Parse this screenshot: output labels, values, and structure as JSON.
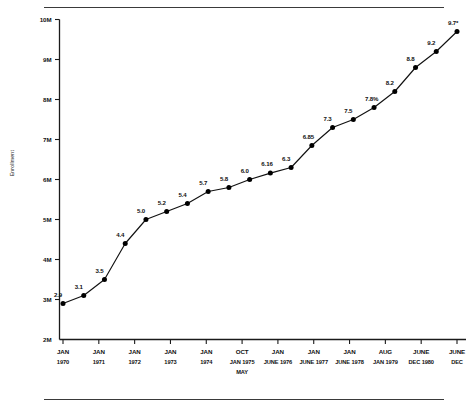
{
  "chart_data": {
    "type": "line",
    "title": "",
    "xlabel": "",
    "ylabel": "Enrollment",
    "ylim": [
      2,
      10
    ],
    "yticks": [
      "2M",
      "3M",
      "4M",
      "5M",
      "6M",
      "7M",
      "8M",
      "9M",
      "10M"
    ],
    "ytick_values": [
      2,
      3,
      4,
      5,
      6,
      7,
      8,
      9,
      10
    ],
    "grid": false,
    "legend": "none",
    "marker": "filled-circle",
    "values": [
      2.9,
      3.1,
      3.5,
      4.4,
      5.0,
      5.2,
      5.4,
      5.7,
      5.8,
      6.0,
      6.16,
      6.3,
      6.85,
      7.3,
      7.5,
      7.8,
      8.2,
      8.8,
      9.2,
      9.7
    ],
    "point_labels": [
      "2.9",
      "3.1",
      "3.5",
      "4.4",
      "5.0",
      "5.2",
      "5.4",
      "5.7",
      "5.8",
      "6.0",
      "6.16",
      "6.3",
      "6.85",
      "7.3",
      "7.5",
      "7.8%",
      "8.2",
      "8.8",
      "9.2",
      "9.7*"
    ],
    "x_axis_ticks": [
      {
        "top": "JAN",
        "bottom": "1970",
        "extra": ""
      },
      {
        "top": "JAN",
        "bottom": "1971",
        "extra": ""
      },
      {
        "top": "JAN",
        "bottom": "1972",
        "extra": ""
      },
      {
        "top": "JAN",
        "bottom": "1973",
        "extra": ""
      },
      {
        "top": "JAN",
        "bottom": "1974",
        "extra": ""
      },
      {
        "top": "OCT",
        "bottom": "JAN 1975",
        "extra": "MAY"
      },
      {
        "top": "JAN",
        "bottom": "JUNE 1976",
        "extra": ""
      },
      {
        "top": "JAN",
        "bottom": "JUNE 1977",
        "extra": ""
      },
      {
        "top": "JAN",
        "bottom": "JUNE 1978",
        "extra": ""
      },
      {
        "top": "AUG",
        "bottom": "JAN 1979",
        "extra": ""
      },
      {
        "top": "JUNE",
        "bottom": "DEC 1980",
        "extra": ""
      },
      {
        "top": "JUNE",
        "bottom": "DEC",
        "extra": ""
      }
    ],
    "colors": {
      "line": "#111111",
      "marker": "#000000",
      "axis": "#1a1a1a",
      "text": "#111111",
      "background": "#ffffff"
    }
  }
}
